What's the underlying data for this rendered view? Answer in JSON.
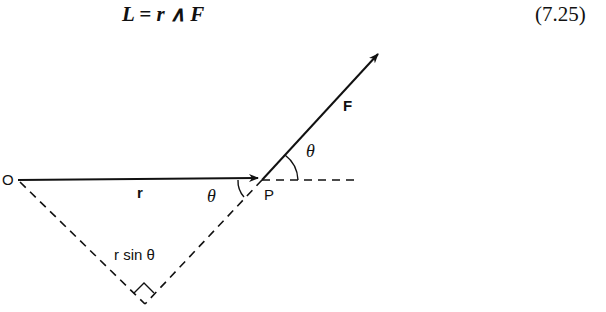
{
  "equation": {
    "text": "L = r ∧ F",
    "number": "(7.25)"
  },
  "diagram": {
    "labels": {
      "origin": "O",
      "point": "P",
      "position_vector": "r",
      "force_vector": "F",
      "angle_at_p": "θ",
      "angle_of_force": "θ",
      "perpendicular_distance": "r sin θ"
    }
  }
}
